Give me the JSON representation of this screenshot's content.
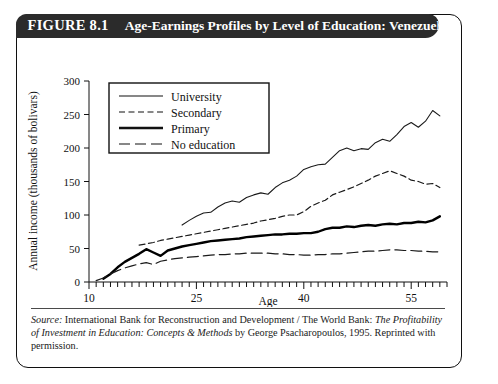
{
  "figure": {
    "number_label": "FIGURE 8.1",
    "title": "Age-Earnings Profiles by Level of Education: Venezuela"
  },
  "source": {
    "label": "Source:",
    "line1_part1": " International Bank for Reconstruction and Development / The World Bank: ",
    "italic_title": "The Profitability of Investment in Education: Concepts & Methods",
    "line1_part2": " by George Psacharopoulos, 1995. Reprinted with permission."
  },
  "chart_data": {
    "type": "line",
    "title": "Age-Earnings Profiles by Level of Education: Venezuela",
    "xlabel": "Age",
    "ylabel": "Annual income (thousands of bolivars)",
    "xlim": [
      10,
      60
    ],
    "ylim": [
      0,
      300
    ],
    "xticks_major": [
      10,
      25,
      40,
      55
    ],
    "xtick_minor_step": 1,
    "yticks": [
      0,
      50,
      100,
      150,
      200,
      250,
      300
    ],
    "grid": false,
    "legend_position": "top-left-inside",
    "series": [
      {
        "name": "University",
        "style": "thin-solid",
        "color": "#1a1a1a",
        "x": [
          23,
          24,
          25,
          26,
          27,
          28,
          29,
          30,
          31,
          32,
          33,
          34,
          35,
          36,
          37,
          38,
          39,
          40,
          41,
          42,
          43,
          44,
          45,
          46,
          47,
          48,
          49,
          50,
          51,
          52,
          53,
          54,
          55,
          56,
          57,
          58,
          59
        ],
        "y": [
          85,
          92,
          98,
          103,
          104,
          112,
          118,
          121,
          119,
          126,
          130,
          133,
          131,
          141,
          148,
          152,
          158,
          168,
          172,
          175,
          176,
          186,
          196,
          200,
          196,
          199,
          198,
          208,
          213,
          210,
          220,
          232,
          238,
          231,
          240,
          256,
          248
        ]
      },
      {
        "name": "Secondary",
        "style": "short-dash",
        "color": "#1a1a1a",
        "x": [
          17,
          18,
          19,
          20,
          21,
          22,
          23,
          24,
          25,
          26,
          27,
          28,
          29,
          30,
          31,
          32,
          33,
          34,
          35,
          36,
          37,
          38,
          39,
          40,
          41,
          42,
          43,
          44,
          45,
          46,
          47,
          48,
          49,
          50,
          51,
          52,
          53,
          54,
          55,
          56,
          57,
          58,
          59
        ],
        "y": [
          55,
          57,
          59,
          62,
          64,
          66,
          68,
          70,
          72,
          74,
          76,
          78,
          80,
          82,
          84,
          86,
          88,
          91,
          93,
          95,
          98,
          100,
          100,
          105,
          113,
          118,
          122,
          130,
          134,
          138,
          142,
          147,
          152,
          158,
          162,
          166,
          162,
          158,
          152,
          150,
          146,
          147,
          141
        ]
      },
      {
        "name": "Primary",
        "style": "thick-solid",
        "color": "#000000",
        "x": [
          12,
          13,
          14,
          15,
          16,
          17,
          18,
          19,
          20,
          21,
          22,
          23,
          24,
          25,
          26,
          27,
          28,
          29,
          30,
          31,
          32,
          33,
          34,
          35,
          36,
          37,
          38,
          39,
          40,
          41,
          42,
          43,
          44,
          45,
          46,
          47,
          48,
          49,
          50,
          51,
          52,
          53,
          54,
          55,
          56,
          57,
          58,
          59
        ],
        "y": [
          5,
          12,
          22,
          30,
          36,
          42,
          49,
          44,
          39,
          47,
          50,
          53,
          55,
          57,
          59,
          61,
          62,
          63,
          64,
          65,
          67,
          68,
          69,
          70,
          71,
          71,
          72,
          72,
          73,
          73,
          75,
          79,
          81,
          81,
          83,
          82,
          84,
          85,
          84,
          86,
          87,
          86,
          88,
          88,
          90,
          89,
          92,
          98
        ]
      },
      {
        "name": "No education",
        "style": "long-dash",
        "color": "#1a1a1a",
        "x": [
          11,
          12,
          13,
          14,
          15,
          16,
          17,
          18,
          19,
          20,
          21,
          22,
          23,
          24,
          25,
          26,
          27,
          28,
          29,
          30,
          31,
          32,
          33,
          34,
          35,
          36,
          37,
          38,
          39,
          40,
          41,
          42,
          43,
          44,
          45,
          46,
          47,
          48,
          49,
          50,
          51,
          52,
          53,
          54,
          55,
          56,
          57,
          58,
          59
        ],
        "y": [
          2,
          6,
          12,
          17,
          21,
          24,
          27,
          29,
          26,
          31,
          33,
          35,
          36,
          37,
          38,
          39,
          40,
          41,
          41,
          42,
          42,
          43,
          43,
          43,
          43,
          42,
          42,
          41,
          41,
          40,
          40,
          41,
          41,
          42,
          42,
          43,
          44,
          45,
          46,
          46,
          47,
          48,
          48,
          47,
          47,
          46,
          46,
          45,
          45
        ]
      }
    ],
    "legend": [
      {
        "label": "University",
        "style": "thin-solid"
      },
      {
        "label": "Secondary",
        "style": "short-dash"
      },
      {
        "label": "Primary",
        "style": "thick-solid"
      },
      {
        "label": "No education",
        "style": "long-dash"
      }
    ]
  }
}
